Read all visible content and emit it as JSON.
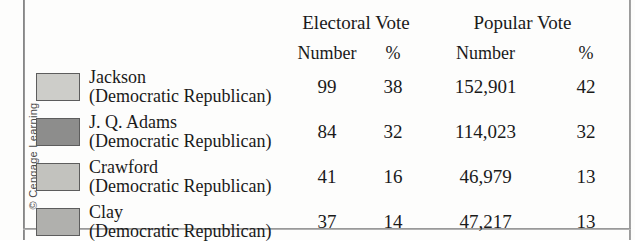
{
  "credit": "© Cengage Learning",
  "table": {
    "group_headers": {
      "electoral": "Electoral Vote",
      "popular": "Popular Vote"
    },
    "sub_headers": {
      "electoral_number": "Number",
      "electoral_percent": "%",
      "popular_number": "Number",
      "popular_percent": "%"
    },
    "rows": [
      {
        "swatch_color": "#cdcdc9",
        "name": "Jackson",
        "party": "(Democratic Republican)",
        "electoral_number": "99",
        "electoral_percent": "38",
        "popular_number": "152,901",
        "popular_percent": "42"
      },
      {
        "swatch_color": "#8d8d8c",
        "name": "J. Q. Adams",
        "party": "(Democratic Republican)",
        "electoral_number": "84",
        "electoral_percent": "32",
        "popular_number": "114,023",
        "popular_percent": "32"
      },
      {
        "swatch_color": "#c2c2be",
        "name": "Crawford",
        "party": "(Democratic Republican)",
        "electoral_number": "41",
        "electoral_percent": "16",
        "popular_number": "46,979",
        "popular_percent": "13"
      },
      {
        "swatch_color": "#b0b0ad",
        "name": "Clay",
        "party": "(Democratic Republican)",
        "electoral_number": "37",
        "electoral_percent": "14",
        "popular_number": "47,217",
        "popular_percent": "13"
      }
    ]
  },
  "chart_data": {
    "type": "table",
    "title": "",
    "categories": [
      "Jackson",
      "J. Q. Adams",
      "Crawford",
      "Clay"
    ],
    "columns": [
      "Electoral Vote Number",
      "Electoral Vote %",
      "Popular Vote Number",
      "Popular Vote %"
    ],
    "series": [
      {
        "name": "Electoral Vote Number",
        "values": [
          99,
          84,
          41,
          37
        ]
      },
      {
        "name": "Electoral Vote %",
        "values": [
          38,
          32,
          16,
          14
        ]
      },
      {
        "name": "Popular Vote Number",
        "values": [
          152901,
          114023,
          46979,
          47217
        ]
      },
      {
        "name": "Popular Vote %",
        "values": [
          42,
          32,
          13,
          13
        ]
      }
    ]
  }
}
